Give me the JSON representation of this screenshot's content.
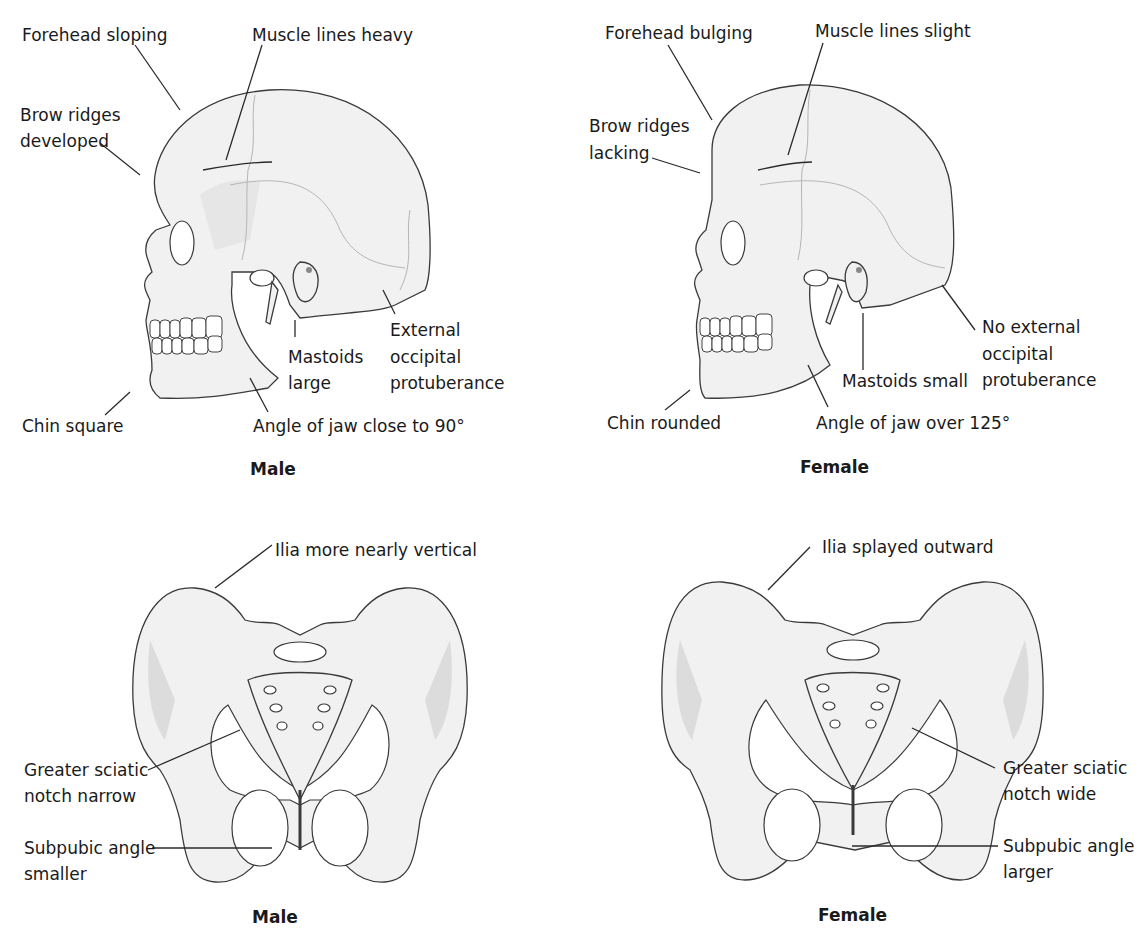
{
  "figure": {
    "skulls": {
      "male": {
        "caption": "Male",
        "labels": {
          "forehead": "Forehead sloping",
          "muscle": "Muscle lines heavy",
          "brow_1": "Brow ridges",
          "brow_2": "developed",
          "occipital_1": "External",
          "occipital_2": "occipital",
          "occipital_3": "protuberance",
          "mastoid_1": "Mastoids",
          "mastoid_2": "large",
          "chin": "Chin square",
          "jaw": "Angle of jaw close to 90°"
        }
      },
      "female": {
        "caption": "Female",
        "labels": {
          "forehead": "Forehead bulging",
          "muscle": "Muscle lines slight",
          "brow_1": "Brow ridges",
          "brow_2": "lacking",
          "occipital_1": "No external",
          "occipital_2": "occipital",
          "occipital_3": "protuberance",
          "mastoid": "Mastoids small",
          "chin": "Chin rounded",
          "jaw": "Angle of jaw over 125°"
        }
      }
    },
    "pelves": {
      "male": {
        "caption": "Male",
        "labels": {
          "ilia": "Ilia more nearly vertical",
          "sciatic_1": "Greater sciatic",
          "sciatic_2": "notch narrow",
          "subpubic_1": "Subpubic angle",
          "subpubic_2": "smaller"
        }
      },
      "female": {
        "caption": "Female",
        "labels": {
          "ilia": "Ilia splayed outward",
          "sciatic_1": "Greater sciatic",
          "sciatic_2": "notch wide",
          "subpubic_1": "Subpubic angle",
          "subpubic_2": "larger"
        }
      }
    }
  }
}
